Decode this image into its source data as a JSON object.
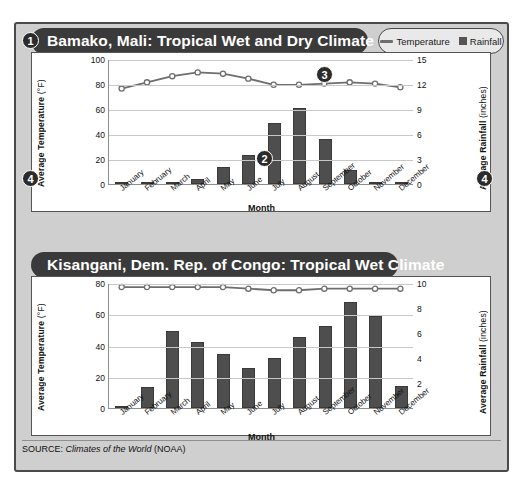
{
  "legend": {
    "temperature_label": "Temperature",
    "rainfall_label": "Rainfall",
    "line_icon": "line-icon",
    "swatch_icon": "square-swatch-icon"
  },
  "callouts": [
    {
      "id": "callout-1",
      "label": "1"
    },
    {
      "id": "callout-2",
      "label": "2"
    },
    {
      "id": "callout-3",
      "label": "3"
    },
    {
      "id": "callout-4-left",
      "label": "4"
    },
    {
      "id": "callout-4-right",
      "label": "4"
    }
  ],
  "source": {
    "prefix": "SOURCE: ",
    "italic": "Climates of the World",
    "suffix": " (NOAA)"
  },
  "charts": [
    {
      "title": "Bamako, Mali: Tropical Wet and Dry Climate",
      "xlabel": "Month",
      "ylabel_main": "Average Temperature ",
      "ylabel_unit": "(°F)",
      "y2label_main": "Average Rainfall ",
      "y2label_unit": "(inches)"
    },
    {
      "title": "Kisangani, Dem. Rep. of Congo: Tropical Wet Climate",
      "xlabel": "Month",
      "ylabel_main": "Average Temperature ",
      "ylabel_unit": "(°F)",
      "y2label_main": "Average Rainfall ",
      "y2label_unit": "(inches)"
    }
  ],
  "chart_data": [
    {
      "type": "bar",
      "title": "Bamako, Mali: Tropical Wet and Dry Climate",
      "xlabel": "Month",
      "ylabel": "Average Temperature (°F)",
      "y2label": "Average Rainfall (inches)",
      "categories": [
        "January",
        "February",
        "March",
        "April",
        "May",
        "June",
        "July",
        "August",
        "September",
        "October",
        "November",
        "December"
      ],
      "yticks": [
        0,
        20,
        40,
        60,
        80,
        100
      ],
      "ylim": [
        0,
        100
      ],
      "y2ticks": [
        0,
        3,
        6,
        9,
        12,
        15
      ],
      "y2lim": [
        0,
        15
      ],
      "grid": true,
      "legend_position": "top-right",
      "series": [
        {
          "name": "Rainfall",
          "axis": "right",
          "type": "bar",
          "unit": "inches",
          "values": [
            0,
            0.1,
            0.3,
            0.6,
            2.0,
            3.5,
            7.3,
            9.1,
            5.4,
            1.7,
            0.2,
            0
          ]
        },
        {
          "name": "Temperature",
          "axis": "left",
          "type": "line",
          "unit": "°F",
          "values": [
            77,
            82,
            87,
            90,
            89,
            85,
            80,
            80,
            81,
            82,
            81,
            78
          ]
        }
      ]
    },
    {
      "type": "bar",
      "title": "Kisangani, Dem. Rep. of Congo: Tropical Wet Climate",
      "xlabel": "Month",
      "ylabel": "Average Temperature (°F)",
      "y2label": "Average Rainfall (inches)",
      "categories": [
        "January",
        "February",
        "March",
        "April",
        "May",
        "June",
        "July",
        "August",
        "September",
        "October",
        "November",
        "December"
      ],
      "yticks": [
        0,
        20,
        40,
        60,
        80
      ],
      "ylim": [
        0,
        80
      ],
      "y2ticks": [
        2,
        4,
        6,
        8,
        10
      ],
      "y2lim": [
        0,
        10
      ],
      "grid": true,
      "legend_position": "top-right",
      "series": [
        {
          "name": "Rainfall",
          "axis": "right",
          "type": "bar",
          "unit": "inches",
          "values": [
            0.2,
            1.7,
            6.2,
            5.3,
            4.3,
            3.2,
            4.0,
            5.7,
            6.6,
            8.5,
            7.4,
            1.8
          ]
        },
        {
          "name": "Temperature",
          "axis": "left",
          "type": "line",
          "unit": "°F",
          "values": [
            78,
            78,
            78,
            78,
            78,
            77,
            76,
            76,
            77,
            77,
            77,
            77
          ]
        }
      ]
    }
  ]
}
